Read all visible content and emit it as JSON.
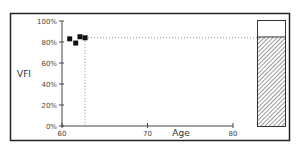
{
  "chart_data": {
    "type": "scatter",
    "title": "",
    "xlabel": "Age",
    "ylabel": "VFI",
    "xlim": [
      60,
      80
    ],
    "ylim": [
      0,
      100
    ],
    "x_ticks": [
      60,
      70,
      80
    ],
    "x_tick_labels": [
      "60",
      "70",
      "80"
    ],
    "y_ticks": [
      0,
      20,
      40,
      60,
      80,
      100
    ],
    "y_tick_labels": [
      "0%",
      "20%",
      "40%",
      "60%",
      "80%",
      "100%"
    ],
    "grid": false,
    "legend": null,
    "series": [
      {
        "name": "VFI measurements",
        "points": [
          {
            "x": 60.9,
            "y": 83
          },
          {
            "x": 61.6,
            "y": 79
          },
          {
            "x": 62.1,
            "y": 85
          },
          {
            "x": 62.7,
            "y": 84
          }
        ]
      }
    ],
    "reference_lines": {
      "current_age": 62.7,
      "current_vfi": 84
    },
    "summary_bar": {
      "value": 84,
      "max": 100,
      "fill": "hatched"
    }
  },
  "colors": {
    "frame": "#222222",
    "axis": "#444444",
    "marker": "#111111",
    "guide": "#888888",
    "hatch": "#555555"
  }
}
